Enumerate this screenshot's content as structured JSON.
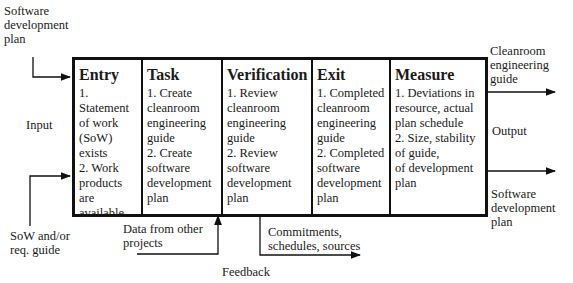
{
  "inputs": {
    "top_input": "Software\ndevelopment\nplan",
    "side_label": "Input",
    "bottom_input": "SoW and/or\nreq. guide"
  },
  "stages": [
    {
      "title": "Entry",
      "items": [
        "1. Statement\nof work\n(SoW)\nexists",
        "2. Work\nproducts\nare\navailable"
      ]
    },
    {
      "title": "Task",
      "items": [
        "1.  Create\ncleanroom\nengineering\nguide",
        "2.  Create\nsoftware\ndevelopment\nplan"
      ]
    },
    {
      "title": "Verification",
      "items": [
        "1.  Review\ncleanroom\nengineering\nguide",
        "2.  Review\nsoftware\ndevelopment\nplan"
      ]
    },
    {
      "title": "Exit",
      "items": [
        "1.  Completed\ncleanroom\nengineering\nguide",
        "2.  Completed\nsoftware\ndevelopment\nplan"
      ]
    },
    {
      "title": "Measure",
      "items": [
        "1.  Deviations in\nresource, actual\nplan schedule",
        "2.  Size, stability\nof guide,\nof development\nplan"
      ]
    }
  ],
  "outputs": {
    "top_output": "Cleanroom\nengineering\nguide",
    "side_label": "Output",
    "bottom_output": "Software\ndevelopment\nplan"
  },
  "bottom": {
    "data_from_other": "Data from other\nprojects",
    "commitments": "Commitments,\nschedules, sources",
    "feedback": "Feedback"
  }
}
